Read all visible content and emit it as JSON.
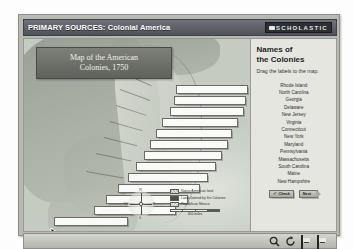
{
  "window": {
    "title_primary": "PRIMARY SOURCES:",
    "title_secondary": "Colonial America",
    "brand": "SCHOLASTIC",
    "brand_icon": "book-glyph-icon"
  },
  "map": {
    "banner_line1": "Map of the American",
    "banner_line2": "Colonies, 1750",
    "compass": {
      "n": "N",
      "s": "S",
      "e": "E",
      "w": "W"
    },
    "legend": [
      {
        "label": "Native American land",
        "swatch": "native-hatch"
      },
      {
        "label": "Land claimed by the Colonies",
        "swatch": "colony-solid"
      },
      {
        "label": "Republican Mexico",
        "swatch": "france-hatch"
      }
    ],
    "scale_label": "400 miles",
    "drop_targets": 13,
    "cursor": "arrow-pointer-icon"
  },
  "panel": {
    "title_line1": "Names of",
    "title_line2": "the Colonies",
    "instruction": "Drag the labels to the map.",
    "colonies": [
      "Rhode Island",
      "North Carolina",
      "Georgia",
      "Delaware",
      "New Jersey",
      "Virginia",
      "Connecticut",
      "New York",
      "Maryland",
      "Pennsylvania",
      "Massachusetts",
      "South Carolina",
      "Maine",
      "New Hampshire"
    ],
    "check_button": "Check",
    "check_icon": "checkmark-icon",
    "next_button": "Next"
  },
  "toolbar": {
    "icons": [
      {
        "name": "magnify-icon",
        "label": "Zoom"
      },
      {
        "name": "reload-icon",
        "label": "Reset"
      },
      {
        "name": "print-icon",
        "label": "Print"
      },
      {
        "name": "notebook-icon",
        "label": "Notes"
      }
    ]
  },
  "colors": {
    "titlebar": "#4f5259",
    "panel_bg": "#e6e6e1",
    "frame": "#b9b9b4",
    "map_land": "#9ea59a",
    "map_ocean": "#cfd4cb"
  }
}
